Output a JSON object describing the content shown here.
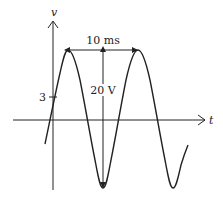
{
  "diagram": {
    "type": "sinusoidal waveform",
    "axes": {
      "vertical_label": "v",
      "horizontal_label": "t",
      "tick_label": "3"
    },
    "annotations": {
      "period_label": "10 ms",
      "peak_to_peak_label": "20 V"
    },
    "colors": {
      "stroke": "#222222",
      "background": "#ffffff"
    }
  }
}
